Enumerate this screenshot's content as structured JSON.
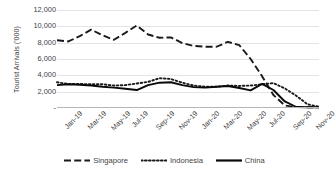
{
  "chart_data": {
    "type": "line",
    "title": "",
    "xlabel": "",
    "ylabel": "Tourist Arrivals ('000)",
    "ylim": [
      0,
      12000
    ],
    "ytick_labels": [
      "12,000",
      "10,000",
      "8,000",
      "6,000",
      "4,000",
      "2,000",
      "-"
    ],
    "ytick_values": [
      12000,
      10000,
      8000,
      6000,
      4000,
      2000,
      0
    ],
    "grid": true,
    "legend_position": "bottom",
    "x": [
      "Jan-19",
      "Feb-19",
      "Mar-19",
      "Apr-19",
      "May-19",
      "Jun-19",
      "Jul-19",
      "Aug-19",
      "Sep-19",
      "Oct-19",
      "Nov-19",
      "Dec-19",
      "Jan-20",
      "Feb-20",
      "Mar-20",
      "Apr-20",
      "May-20",
      "Jun-20",
      "Jul-20",
      "Aug-20",
      "Sep-20",
      "Oct-20",
      "Nov-20",
      "Dec-20"
    ],
    "xtick_labels": [
      "Jan-19",
      "Mar-19",
      "May-19",
      "Jul-19",
      "Sep-19",
      "Nov-19",
      "Jan-20",
      "Mar-20",
      "May-20",
      "Jul-20",
      "Sep-20",
      "Nov-20"
    ],
    "xtick_indices": [
      0,
      2,
      4,
      6,
      8,
      10,
      12,
      14,
      16,
      18,
      20,
      22
    ],
    "series": [
      {
        "name": "Singapore",
        "style": "dashed",
        "color": "#1a1a1a",
        "values": [
          8300,
          8150,
          8800,
          9600,
          8900,
          8350,
          9200,
          10100,
          9000,
          8600,
          8650,
          7950,
          7600,
          7500,
          7500,
          8100,
          7700,
          6000,
          3900,
          1600,
          300,
          120,
          100,
          100
        ]
      },
      {
        "name": "Indonesia",
        "style": "dotted",
        "color": "#1a1a1a",
        "values": [
          3150,
          2950,
          2950,
          2900,
          2900,
          2750,
          2800,
          3000,
          3200,
          3650,
          3550,
          3100,
          2750,
          2600,
          2600,
          2750,
          2700,
          2750,
          2900,
          3050,
          2400,
          1500,
          450,
          150
        ]
      },
      {
        "name": "China",
        "style": "solid",
        "color": "#0a0a0a",
        "values": [
          2800,
          2900,
          2850,
          2750,
          2600,
          2500,
          2350,
          2200,
          2800,
          3100,
          3150,
          2800,
          2550,
          2500,
          2600,
          2700,
          2450,
          2150,
          2950,
          2200,
          800,
          120,
          100,
          100
        ]
      }
    ]
  },
  "legend": {
    "items": [
      {
        "label": "Singapore",
        "icon": "dashed-line-icon"
      },
      {
        "label": "Indonesia",
        "icon": "dotted-line-icon"
      },
      {
        "label": "China",
        "icon": "solid-line-icon"
      }
    ]
  }
}
